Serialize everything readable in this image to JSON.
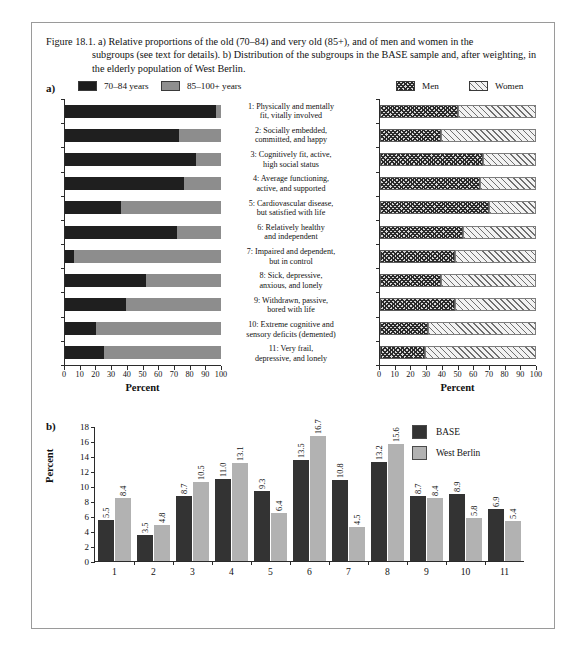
{
  "figure": {
    "caption_first": "Figure 18.1. a) Relative proportions of the old (70–84) and very old (85+), and of men and women in the",
    "caption_rest": "subgroups (see text for details). b) Distribution of the subgroups in the BASE sample and, after weighting, in the elderly population of West Berlin."
  },
  "panel_a": {
    "label": "a)",
    "legend_age": [
      {
        "key": "old",
        "label": "70–84 years",
        "color": "#1f1f1f"
      },
      {
        "key": "veryold",
        "label": "85–100+ years",
        "color": "#8d8d8d"
      }
    ],
    "legend_sex": [
      {
        "key": "men",
        "label": "Men",
        "pattern": "cross-hatch"
      },
      {
        "key": "women",
        "label": "Women",
        "pattern": "diagonal-hatch"
      }
    ],
    "subgroup_labels": [
      "1: Physically and mentally\nfit, vitally involved",
      "2: Socially embedded,\ncommitted, and happy",
      "3: Cognitively fit, active,\nhigh social status",
      "4: Average functioning,\nactive, and supported",
      "5: Cardiovascular disease,\nbut satisfied with life",
      "6: Relatively healthy\nand independent",
      "7: Impaired and dependent,\nbut in control",
      "8: Sick, depressive,\nanxious, and lonely",
      "9: Withdrawn, passive,\nbored with life",
      "10: Extreme cognitive and\nsensory deficits (demented)",
      "11: Very frail,\ndepressive, and lonely"
    ],
    "axis_title": "Percent",
    "ticks": [
      0,
      10,
      20,
      30,
      40,
      50,
      60,
      70,
      80,
      90,
      100
    ]
  },
  "panel_b": {
    "label": "b)",
    "legend": [
      {
        "key": "base",
        "label": "BASE",
        "color": "#333333"
      },
      {
        "key": "west_berlin",
        "label": "West Berlin",
        "color": "#b2b2b2"
      }
    ],
    "ylabel": "Percent"
  },
  "chart_data": [
    {
      "id": "panel-a-age",
      "type": "bar",
      "orientation": "horizontal",
      "stacked": true,
      "title": "",
      "xlabel": "Percent",
      "ylabel": "",
      "xlim": [
        0,
        100
      ],
      "xticks": [
        0,
        10,
        20,
        30,
        40,
        50,
        60,
        70,
        80,
        90,
        100
      ],
      "grid": false,
      "categories": [
        "1",
        "2",
        "3",
        "4",
        "5",
        "6",
        "7",
        "8",
        "9",
        "10",
        "11"
      ],
      "series": [
        {
          "name": "70–84 years",
          "color": "#1f1f1f",
          "values": [
            97,
            73,
            84,
            76,
            36,
            72,
            6,
            52,
            39,
            20,
            25
          ]
        },
        {
          "name": "85–100+ years",
          "color": "#8d8d8d",
          "values": [
            3,
            27,
            16,
            24,
            64,
            28,
            94,
            48,
            61,
            80,
            75
          ]
        }
      ]
    },
    {
      "id": "panel-a-sex",
      "type": "bar",
      "orientation": "horizontal",
      "stacked": true,
      "title": "",
      "xlabel": "Percent",
      "ylabel": "",
      "xlim": [
        0,
        100
      ],
      "xticks": [
        0,
        10,
        20,
        30,
        40,
        50,
        60,
        70,
        80,
        90,
        100
      ],
      "grid": false,
      "categories": [
        "1",
        "2",
        "3",
        "4",
        "5",
        "6",
        "7",
        "8",
        "9",
        "10",
        "11"
      ],
      "series": [
        {
          "name": "Men",
          "pattern": "cross-hatch",
          "values": [
            50,
            39,
            66,
            64,
            70,
            53,
            48,
            39,
            48,
            31,
            29
          ]
        },
        {
          "name": "Women",
          "pattern": "diagonal-hatch",
          "values": [
            50,
            61,
            34,
            36,
            30,
            47,
            52,
            61,
            52,
            69,
            71
          ]
        }
      ]
    },
    {
      "id": "panel-b",
      "type": "bar",
      "orientation": "vertical",
      "stacked": false,
      "title": "",
      "xlabel": "",
      "ylabel": "Percent",
      "ylim": [
        0,
        18
      ],
      "yticks": [
        0,
        2,
        4,
        6,
        8,
        10,
        12,
        14,
        16,
        18
      ],
      "grid": false,
      "legend_position": "top-right",
      "categories": [
        "1",
        "2",
        "3",
        "4",
        "5",
        "6",
        "7",
        "8",
        "9",
        "10",
        "11"
      ],
      "series": [
        {
          "name": "BASE",
          "color": "#333333",
          "values": [
            5.5,
            3.5,
            8.7,
            11.0,
            9.3,
            13.5,
            10.8,
            13.2,
            8.7,
            8.9,
            6.9
          ]
        },
        {
          "name": "West Berlin",
          "color": "#b2b2b2",
          "values": [
            8.4,
            4.8,
            10.5,
            13.1,
            6.4,
            16.7,
            4.5,
            15.6,
            8.4,
            5.8,
            5.4
          ]
        }
      ]
    }
  ]
}
